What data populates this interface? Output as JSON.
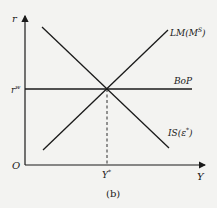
{
  "diagram": {
    "caption": "(b)",
    "axes": {
      "y_label": "r",
      "x_label": "Y",
      "origin_label": "O"
    },
    "curves": {
      "lm": {
        "label": "LM(M",
        "sup": "S",
        "close": ")"
      },
      "is": {
        "label": "IS(ε",
        "sup": "*",
        "close": ")"
      },
      "bop": {
        "label": "BoP"
      }
    },
    "equilibrium": {
      "r_label": "r",
      "r_sup": "w",
      "y_label": "Y",
      "y_sup": "*"
    },
    "colors": {
      "line": "#1a1a1a",
      "background": "#f3f3f1"
    }
  }
}
